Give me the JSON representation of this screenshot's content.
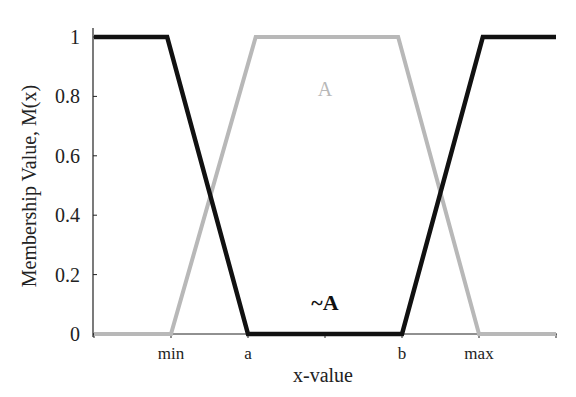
{
  "chart_data": {
    "type": "line",
    "title": "",
    "xlabel": "x-value",
    "ylabel": "Membership Value, M(x)",
    "ylim": [
      0,
      1
    ],
    "grid": false,
    "x_tick_labels": [
      "",
      "min",
      "a",
      "",
      "b",
      "max",
      ""
    ],
    "y_tick_labels": [
      "0",
      "0.2",
      "0.4",
      "0.6",
      "0.8",
      "1"
    ],
    "x_positions": {
      "start": 0,
      "min": 1,
      "a": 2,
      "mid": 3,
      "b": 4,
      "max": 5,
      "end": 6
    },
    "series": [
      {
        "name": "A",
        "color": "#b8b8b8",
        "points": [
          [
            0,
            0
          ],
          [
            1,
            0
          ],
          [
            2.1,
            1
          ],
          [
            3.95,
            1
          ],
          [
            5,
            0
          ],
          [
            6,
            0
          ]
        ]
      },
      {
        "name": "~A",
        "color": "#111111",
        "points": [
          [
            0,
            1
          ],
          [
            0.95,
            1
          ],
          [
            2,
            0
          ],
          [
            4,
            0
          ],
          [
            5.05,
            1
          ],
          [
            6,
            1
          ]
        ]
      }
    ],
    "annotations": [
      {
        "text": "A",
        "x": 3.0,
        "y": 0.8,
        "color": "#b8b8b8"
      },
      {
        "text": "~A",
        "x": 3.0,
        "y": 0.08,
        "color": "#111111",
        "bold": true
      }
    ]
  }
}
